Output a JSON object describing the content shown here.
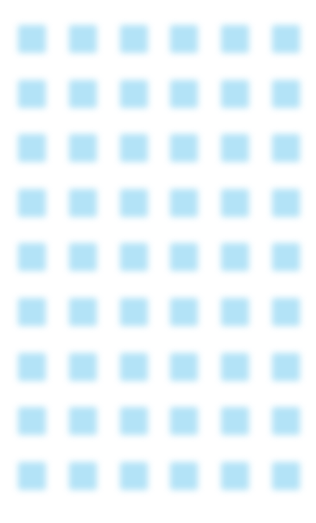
{
  "page": {
    "background_color": "#ffffff",
    "width": 316,
    "height": 523
  },
  "pattern": {
    "name": "square-grid",
    "shape": "square",
    "columns": 6,
    "rows": 9,
    "total_cells": 54,
    "cell_width": 28,
    "cell_height": 28,
    "column_pitch": 50.8,
    "row_pitch": 54.6,
    "origin_x": 18,
    "origin_y": 25,
    "fill_color": "#b3e3f7",
    "glow_color": "#d9f1fb",
    "blur_radius": 3.2,
    "corner_radius": 2,
    "opacity": 1
  },
  "chart_data": {
    "type": "heatmap",
    "title": "",
    "xlabel": "",
    "ylabel": "",
    "columns": 6,
    "rows": 9,
    "uniform_value": 1,
    "legend": "none",
    "grid": false,
    "values": [
      [
        1,
        1,
        1,
        1,
        1,
        1
      ],
      [
        1,
        1,
        1,
        1,
        1,
        1
      ],
      [
        1,
        1,
        1,
        1,
        1,
        1
      ],
      [
        1,
        1,
        1,
        1,
        1,
        1
      ],
      [
        1,
        1,
        1,
        1,
        1,
        1
      ],
      [
        1,
        1,
        1,
        1,
        1,
        1
      ],
      [
        1,
        1,
        1,
        1,
        1,
        1
      ],
      [
        1,
        1,
        1,
        1,
        1,
        1
      ],
      [
        1,
        1,
        1,
        1,
        1,
        1
      ]
    ]
  }
}
